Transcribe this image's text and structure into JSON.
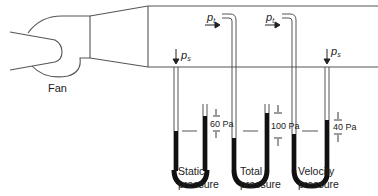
{
  "diagram": {
    "fan_label": "Fan",
    "probes": [
      {
        "symbol": "p",
        "subscript": "s"
      },
      {
        "symbol": "p",
        "subscript": "t"
      },
      {
        "symbol": "p",
        "subscript": "t"
      },
      {
        "symbol": "p",
        "subscript": "s"
      }
    ],
    "manometers": [
      {
        "reading": "60 Pa",
        "label_line1": "Static",
        "label_line2": "pressure"
      },
      {
        "reading": "100 Pa",
        "label_line1": "Total",
        "label_line2": "pressure"
      },
      {
        "reading": "40 Pa",
        "label_line1": "Velocity",
        "label_line2": "pressure"
      }
    ],
    "colors": {
      "line": "#555555",
      "fluid": "#111111"
    }
  }
}
